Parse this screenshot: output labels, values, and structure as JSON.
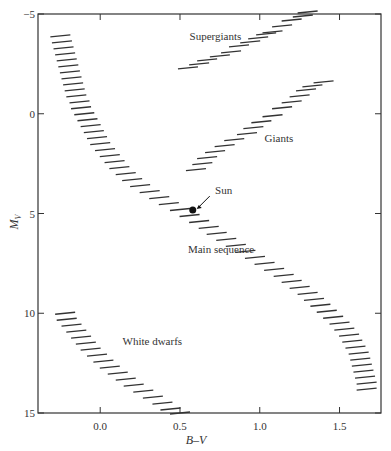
{
  "chart_data": {
    "type": "scatter",
    "title": "",
    "xlabel": "B–V",
    "ylabel": "M_V",
    "ylabel_main": "M",
    "ylabel_sub": "V",
    "xlim": [
      -0.39,
      1.76
    ],
    "ylim": [
      15,
      -5
    ],
    "y_inverted": true,
    "grid": false,
    "legend": "none",
    "x_ticks": [
      0.0,
      0.5,
      1.0,
      1.5
    ],
    "x_tick_labels": [
      "0.0",
      "0.5",
      "1.0",
      "1.5"
    ],
    "y_ticks": [
      -5,
      0,
      5,
      10,
      15
    ],
    "y_tick_labels": [
      "−5",
      "0",
      "5",
      "10",
      "15"
    ],
    "annotations": [
      {
        "text": "Supergiants",
        "bv": 0.56,
        "mv": -3.7
      },
      {
        "text": "Giants",
        "bv": 1.03,
        "mv": 1.4
      },
      {
        "text": "Sun",
        "bv": 0.72,
        "mv": 4.0
      },
      {
        "text": "Main sequence",
        "bv": 0.55,
        "mv": 7.0
      },
      {
        "text": "White dwarfs",
        "bv": 0.14,
        "mv": 11.6
      }
    ],
    "sun": {
      "bv": 0.58,
      "mv": 4.83
    },
    "series": [
      {
        "name": "Supergiants",
        "points": [
          [
            0.55,
            -2.3
          ],
          [
            0.62,
            -2.5
          ],
          [
            0.67,
            -2.7
          ],
          [
            0.75,
            -2.9
          ],
          [
            0.82,
            -3.1
          ],
          [
            0.87,
            -3.4
          ],
          [
            0.94,
            -3.6
          ],
          [
            0.99,
            -3.8
          ],
          [
            1.04,
            -4.0
          ],
          [
            1.08,
            -4.1
          ],
          [
            1.14,
            -4.4
          ],
          [
            1.2,
            -4.7
          ],
          [
            1.27,
            -4.9
          ],
          [
            1.3,
            -5.1
          ]
        ]
      },
      {
        "name": "Giants",
        "points": [
          [
            0.6,
            2.8
          ],
          [
            0.64,
            2.5
          ],
          [
            0.67,
            2.2
          ],
          [
            0.72,
            1.9
          ],
          [
            0.78,
            1.6
          ],
          [
            0.84,
            1.3
          ],
          [
            0.92,
            1.0
          ],
          [
            0.96,
            0.7
          ],
          [
            1.01,
            0.4
          ],
          [
            1.08,
            0.1
          ],
          [
            1.14,
            -0.3
          ],
          [
            1.2,
            -0.6
          ],
          [
            1.25,
            -0.9
          ],
          [
            1.29,
            -1.2
          ],
          [
            1.33,
            -1.4
          ],
          [
            1.4,
            -1.6
          ]
        ]
      },
      {
        "name": "Main sequence",
        "points": [
          [
            -0.25,
            -3.9
          ],
          [
            -0.24,
            -3.6
          ],
          [
            -0.23,
            -3.3
          ],
          [
            -0.22,
            -3.0
          ],
          [
            -0.21,
            -2.7
          ],
          [
            -0.2,
            -2.4
          ],
          [
            -0.19,
            -2.1
          ],
          [
            -0.18,
            -1.8
          ],
          [
            -0.17,
            -1.5
          ],
          [
            -0.16,
            -1.2
          ],
          [
            -0.15,
            -0.9
          ],
          [
            -0.13,
            -0.6
          ],
          [
            -0.12,
            -0.3
          ],
          [
            -0.1,
            0.0
          ],
          [
            -0.08,
            0.3
          ],
          [
            -0.06,
            0.6
          ],
          [
            -0.04,
            0.9
          ],
          [
            -0.02,
            1.2
          ],
          [
            0.0,
            1.5
          ],
          [
            0.03,
            1.8
          ],
          [
            0.06,
            2.1
          ],
          [
            0.09,
            2.4
          ],
          [
            0.12,
            2.7
          ],
          [
            0.16,
            3.0
          ],
          [
            0.2,
            3.3
          ],
          [
            0.25,
            3.6
          ],
          [
            0.31,
            3.9
          ],
          [
            0.37,
            4.2
          ],
          [
            0.43,
            4.5
          ],
          [
            0.5,
            4.8
          ],
          [
            0.56,
            5.1
          ],
          [
            0.62,
            5.4
          ],
          [
            0.68,
            5.7
          ],
          [
            0.73,
            6.0
          ],
          [
            0.79,
            6.3
          ],
          [
            0.85,
            6.6
          ],
          [
            0.91,
            6.9
          ],
          [
            0.97,
            7.2
          ],
          [
            1.03,
            7.5
          ],
          [
            1.09,
            7.8
          ],
          [
            1.15,
            8.1
          ],
          [
            1.2,
            8.4
          ],
          [
            1.25,
            8.7
          ],
          [
            1.3,
            9.0
          ],
          [
            1.34,
            9.3
          ],
          [
            1.38,
            9.6
          ],
          [
            1.42,
            9.9
          ],
          [
            1.46,
            10.2
          ],
          [
            1.5,
            10.5
          ],
          [
            1.53,
            10.8
          ],
          [
            1.56,
            11.1
          ],
          [
            1.58,
            11.4
          ],
          [
            1.6,
            11.7
          ],
          [
            1.62,
            12.0
          ],
          [
            1.63,
            12.3
          ],
          [
            1.64,
            12.6
          ],
          [
            1.65,
            12.9
          ],
          [
            1.66,
            13.2
          ],
          [
            1.67,
            13.5
          ],
          [
            1.67,
            13.8
          ]
        ]
      },
      {
        "name": "White dwarfs",
        "points": [
          [
            -0.22,
            10.0
          ],
          [
            -0.21,
            10.3
          ],
          [
            -0.18,
            10.6
          ],
          [
            -0.15,
            10.9
          ],
          [
            -0.12,
            11.2
          ],
          [
            -0.09,
            11.5
          ],
          [
            -0.06,
            11.8
          ],
          [
            -0.02,
            12.1
          ],
          [
            0.02,
            12.4
          ],
          [
            0.06,
            12.7
          ],
          [
            0.11,
            13.0
          ],
          [
            0.16,
            13.3
          ],
          [
            0.21,
            13.6
          ],
          [
            0.27,
            13.9
          ],
          [
            0.33,
            14.2
          ],
          [
            0.39,
            14.5
          ],
          [
            0.44,
            14.8
          ],
          [
            0.5,
            15.0
          ]
        ]
      }
    ]
  }
}
